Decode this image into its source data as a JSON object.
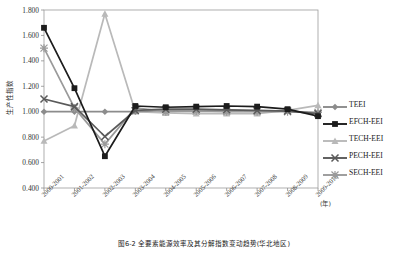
{
  "chart_data": {
    "type": "line",
    "title": "",
    "xlabel": "(年)",
    "ylabel": "生产性指数",
    "ylim": [
      0.4,
      1.8
    ],
    "ytick_labels": [
      "1.800",
      "1.600",
      "1.400",
      "1.200",
      "1.000",
      "0.800",
      "0.600",
      "0.400"
    ],
    "ytick_values": [
      1.8,
      1.6,
      1.4,
      1.2,
      1.0,
      0.8,
      0.6,
      0.4
    ],
    "grid": false,
    "legend_position": "right",
    "categories": [
      "2000-2001",
      "2001-2002",
      "2002-2003",
      "2003-2004",
      "2004-2005",
      "2005-2006",
      "2006-2007",
      "2007-2008",
      "2008-2009",
      "2009-2010"
    ],
    "series": [
      {
        "name": "TEEI",
        "marker": "diamond",
        "color": "#8c8c8c",
        "values": [
          1.0,
          1.0,
          1.0,
          1.0,
          1.01,
          1.015,
          1.01,
          1.005,
          1.005,
          0.99
        ]
      },
      {
        "name": "EFCH-EEI",
        "marker": "square",
        "color": "#1c1c1c",
        "values": [
          1.66,
          1.185,
          0.65,
          1.045,
          1.035,
          1.04,
          1.045,
          1.04,
          1.02,
          0.965
        ]
      },
      {
        "name": "TECH-EEI",
        "marker": "triangle",
        "color": "#b9b9b9",
        "values": [
          0.77,
          0.89,
          1.77,
          1.0,
          0.99,
          0.985,
          0.985,
          0.985,
          1.01,
          1.05
        ]
      },
      {
        "name": "PECH-EEI",
        "marker": "cross",
        "color": "#5a5a5a",
        "values": [
          1.1,
          1.04,
          0.805,
          1.01,
          1.02,
          1.02,
          1.015,
          1.01,
          1.005,
          0.985
        ]
      },
      {
        "name": "SECH-EEI",
        "marker": "star",
        "color": "#9a9a9a",
        "values": [
          1.5,
          1.03,
          0.745,
          1.03,
          1.0,
          1.005,
          1.0,
          1.0,
          1.0,
          0.995
        ]
      }
    ]
  },
  "caption": {
    "text": "图6-2  全要素能源效率及其分解指数变动趋势(华北地区)"
  }
}
